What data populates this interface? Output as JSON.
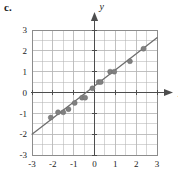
{
  "part_label": "c.",
  "chart_data": {
    "type": "scatter",
    "title": "",
    "subtitle": "",
    "xlabel": "x",
    "ylabel": "y",
    "xlim": [
      -3,
      3
    ],
    "ylim": [
      -3,
      3
    ],
    "xticks": [
      -3,
      -2,
      -1,
      0,
      1,
      2,
      3
    ],
    "yticks": [
      -3,
      -2,
      -1,
      0,
      1,
      2,
      3
    ],
    "xtick_labels": [
      "-3",
      "-2",
      "-1",
      "0",
      "1",
      "2",
      "3"
    ],
    "ytick_labels": [
      "-3",
      "-2",
      "-1",
      "0",
      "1",
      "2",
      "3"
    ],
    "grid": true,
    "grid_minor_step": 0.5,
    "grid_major_step": 1,
    "legend": "none",
    "axis_arrows": true,
    "point_color": "#808080",
    "line_color": "#6e6e6e",
    "grid_color": "#b5b5b5",
    "axis_color": "#4d4d4d",
    "series": [
      {
        "name": "data points",
        "marker": "circle",
        "points": [
          [
            -2.1,
            -1.2
          ],
          [
            -1.75,
            -0.95
          ],
          [
            -1.5,
            -0.95
          ],
          [
            -1.25,
            -0.8
          ],
          [
            -0.95,
            -0.5
          ],
          [
            -0.6,
            -0.25
          ],
          [
            -0.45,
            -0.25
          ],
          [
            -0.1,
            0.2
          ],
          [
            0.2,
            0.5
          ],
          [
            0.3,
            0.5
          ],
          [
            0.75,
            1.0
          ],
          [
            0.95,
            1.0
          ],
          [
            1.7,
            1.5
          ],
          [
            2.35,
            2.1
          ]
        ]
      },
      {
        "name": "line of best fit",
        "type": "line",
        "slope": 0.77,
        "intercept": 0.32,
        "endpoints": [
          [
            -3,
            -2.0
          ],
          [
            3,
            2.63
          ]
        ]
      }
    ]
  }
}
